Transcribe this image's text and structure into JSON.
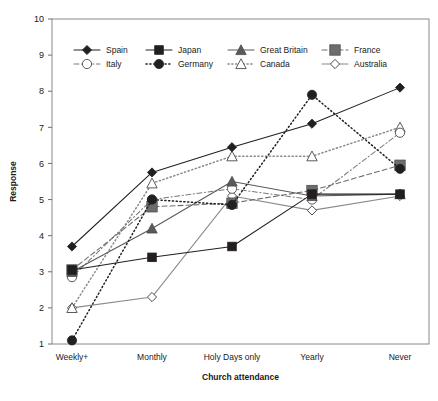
{
  "chart_data": {
    "type": "line",
    "title": "",
    "xlabel": "Church attendance",
    "ylabel": "Response",
    "categories": [
      "Weekly+",
      "Monthly",
      "Holy Days only",
      "Yearly",
      "Never"
    ],
    "ylim": [
      1,
      10
    ],
    "yticks": [
      1,
      2,
      3,
      4,
      5,
      6,
      7,
      8,
      9,
      10
    ],
    "grid": false,
    "legend_position": "top-inside",
    "series": [
      {
        "name": "Spain",
        "values": [
          3.7,
          5.75,
          6.45,
          7.1,
          8.1
        ],
        "marker": "diamond-filled",
        "line": "solid",
        "color": "#231f20"
      },
      {
        "name": "Japan",
        "values": [
          3.05,
          3.4,
          3.7,
          5.15,
          5.15
        ],
        "marker": "square-filled",
        "line": "solid",
        "color": "#231f20"
      },
      {
        "name": "Great Britain",
        "values": [
          3.0,
          4.2,
          5.5,
          5.1,
          5.15
        ],
        "marker": "triangle-filled",
        "line": "solid",
        "color": "#5a5a5a"
      },
      {
        "name": "France",
        "values": [
          3.05,
          4.8,
          4.9,
          5.25,
          5.95
        ],
        "marker": "square-grey",
        "line": "dashed",
        "color": "#6d6d6d"
      },
      {
        "name": "Italy",
        "values": [
          2.85,
          5.0,
          5.3,
          5.0,
          6.85
        ],
        "marker": "circle-open",
        "line": "dash-dot",
        "color": "#7a7a7a"
      },
      {
        "name": "Germany",
        "values": [
          1.1,
          5.0,
          4.85,
          7.9,
          5.85
        ],
        "marker": "circle-filled",
        "line": "dotted",
        "color": "#231f20"
      },
      {
        "name": "Canada",
        "values": [
          2.0,
          5.45,
          6.2,
          6.2,
          7.0
        ],
        "marker": "triangle-open",
        "line": "dotted",
        "color": "#8a8a8a"
      },
      {
        "name": "Australia",
        "values": [
          2.0,
          2.3,
          5.1,
          4.7,
          5.1
        ],
        "marker": "diamond-open",
        "line": "solid",
        "color": "#8a8a8a"
      }
    ]
  },
  "legend": {
    "row1": [
      "Spain",
      "Japan",
      "Great Britain",
      "France"
    ],
    "row2": [
      "Italy",
      "Germany",
      "Canada",
      "Australia"
    ]
  },
  "axes": {
    "y_title": "Response",
    "x_title": "Church attendance"
  }
}
